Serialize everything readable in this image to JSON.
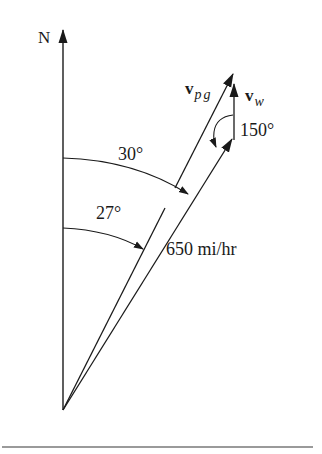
{
  "figure": {
    "north_label": "N",
    "vectors": {
      "v_pg": {
        "symbol": "v",
        "subscript": "pg",
        "angle_from_north_deg": 27
      },
      "v_w": {
        "symbol": "v",
        "subscript": "w"
      },
      "heading": {
        "speed_label": "650 mi/hr",
        "angle_from_north_deg": 30
      }
    },
    "angles": {
      "heading_angle_label": "30°",
      "ground_angle_label": "27°",
      "wind_angle_label": "150°"
    },
    "colors": {
      "ink": "#1a1a1a",
      "rule": "#9a9a9a",
      "background": "#ffffff"
    }
  }
}
